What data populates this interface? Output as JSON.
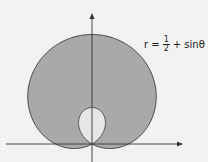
{
  "figure": {
    "equation_label": {
      "lhs": "r =",
      "frac_num": "1",
      "frac_den": "2",
      "rhs": "+ sinθ"
    },
    "colors": {
      "background": "#f2f2f0",
      "outer_fill": "#a9a9a9",
      "inner_fill": "#e6e6e4",
      "stroke": "#3a3a3a",
      "axis": "#333333"
    }
  },
  "chart_data": {
    "type": "polar-curve",
    "title": "",
    "curve": "r = 1/2 + sinθ",
    "a": 0.5,
    "b": 1,
    "shaded_region": "inside outer loop, excluding inner loop",
    "outer_loop_theta": [
      -0.5236,
      3.6652
    ],
    "inner_loop_theta": [
      3.6652,
      5.7596
    ],
    "origin_px": [
      92,
      144
    ],
    "unit_px": 73,
    "axes": {
      "x_arrow": true,
      "y_arrow": true,
      "tick_labels": []
    }
  }
}
